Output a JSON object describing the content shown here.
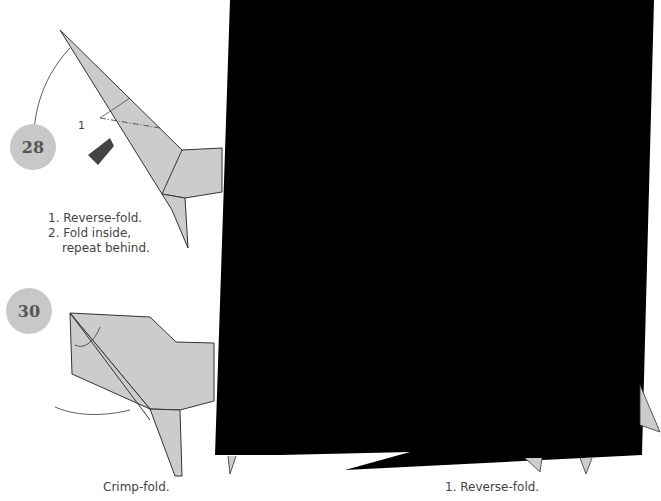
{
  "steps": [
    {
      "number": "28",
      "instructions": [
        "1. Reverse-fold.",
        "2. Fold inside,",
        "repeat behind."
      ],
      "label_marker": "1"
    },
    {
      "number": "30",
      "instructions": [
        "Crimp-fold."
      ]
    },
    {
      "number": "",
      "instructions": [
        "1. Reverse-fold."
      ]
    }
  ],
  "colors": {
    "paper": "#cccccc",
    "line": "#333333",
    "redaction": "#000000",
    "badge": "#c8c8c8"
  }
}
